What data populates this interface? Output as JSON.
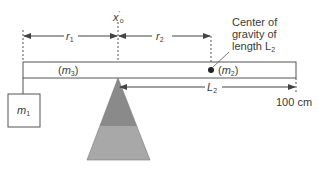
{
  "diagram": {
    "type": "lever balance with fulcrum",
    "labels": {
      "x0": "x",
      "x0_prime": "'",
      "x0_sub": "o",
      "r1": "r",
      "r1_sub": "1",
      "r2": "r",
      "r2_sub": "2",
      "m3": "m",
      "m3_sub": "3",
      "m2": "m",
      "m2_sub": "2",
      "m1": "m",
      "m1_sub": "1",
      "L2": "L",
      "L2_sub": "2",
      "end_mark": "100 cm",
      "annotation_line1": "Center of",
      "annotation_line2": "gravity of",
      "annotation_line3": "length L",
      "annotation_sub": "2"
    },
    "colors": {
      "line": "#555555",
      "fulcrum_top": "#8a8a8a",
      "fulcrum_bottom": "#a8a8a8",
      "background": "#ffffff"
    }
  }
}
